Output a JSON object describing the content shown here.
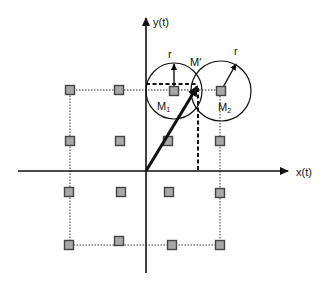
{
  "diagram": {
    "type": "constellation-diagram",
    "colors": {
      "background": "#ffffff",
      "stroke": "#111111",
      "point_fill": "#a8a8a8",
      "point_stroke": "#444444"
    },
    "axes": {
      "origin": [
        146,
        171
      ],
      "x_axis": {
        "label": "x(t)",
        "from": [
          18,
          171
        ],
        "to": [
          288,
          171
        ],
        "label_pos": [
          296,
          176
        ]
      },
      "y_axis": {
        "label": "y(t)",
        "from": [
          146,
          273
        ],
        "to": [
          146,
          18
        ],
        "label_pos": [
          153,
          26
        ]
      }
    },
    "points": [
      {
        "x": 70,
        "y": 90
      },
      {
        "x": 119,
        "y": 90
      },
      {
        "x": 174,
        "y": 91
      },
      {
        "x": 221,
        "y": 91
      },
      {
        "x": 70,
        "y": 141
      },
      {
        "x": 120,
        "y": 141
      },
      {
        "x": 168,
        "y": 141
      },
      {
        "x": 220,
        "y": 141
      },
      {
        "x": 69,
        "y": 192
      },
      {
        "x": 121,
        "y": 192
      },
      {
        "x": 169,
        "y": 192
      },
      {
        "x": 220,
        "y": 193
      },
      {
        "x": 69,
        "y": 245
      },
      {
        "x": 119,
        "y": 241
      },
      {
        "x": 172,
        "y": 245
      },
      {
        "x": 220,
        "y": 245
      }
    ],
    "boundary_box": {
      "x1": 70,
      "y1": 90,
      "x2": 220,
      "y2": 245
    },
    "circles": [
      {
        "id": "M1",
        "cx": 174,
        "cy": 91,
        "r": 28,
        "label": "M",
        "sub": "1",
        "label_pos": [
          157,
          110
        ]
      },
      {
        "id": "M2",
        "cx": 221,
        "cy": 91,
        "r": 30,
        "label": "M",
        "sub": "2",
        "label_pos": [
          218,
          111
        ]
      }
    ],
    "radius_arrows": [
      {
        "from": [
          174,
          91
        ],
        "to": [
          174,
          64
        ],
        "label": "r",
        "label_pos": [
          168,
          58
        ]
      },
      {
        "from": [
          221,
          91
        ],
        "to": [
          236,
          64
        ],
        "label": "r",
        "label_pos": [
          234,
          55
        ]
      }
    ],
    "vector": {
      "from": [
        146,
        171
      ],
      "to": [
        197,
        87
      ],
      "label": "M′",
      "label_pos": [
        190,
        66
      ]
    },
    "projections": {
      "horizontal": {
        "from": [
          146,
          84
        ],
        "to": [
          197,
          84
        ]
      },
      "vertical": {
        "from": [
          198,
          88
        ],
        "to": [
          198,
          171
        ]
      }
    }
  }
}
